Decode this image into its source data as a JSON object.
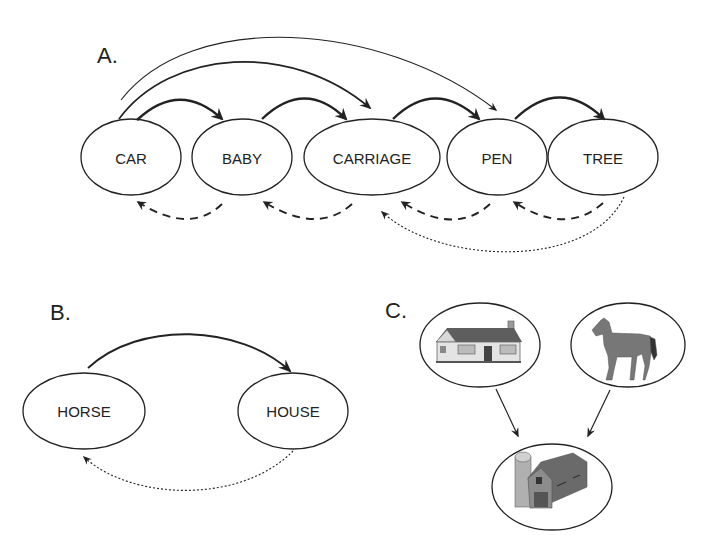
{
  "panels": {
    "a": {
      "label": "A.",
      "nodes": [
        {
          "id": "car",
          "label": "CAR"
        },
        {
          "id": "baby",
          "label": "BABY"
        },
        {
          "id": "carriage",
          "label": "CARRIAGE"
        },
        {
          "id": "pen",
          "label": "PEN"
        },
        {
          "id": "tree",
          "label": "TREE"
        }
      ],
      "edges": [
        {
          "from": "car",
          "to": "baby",
          "style": "solid-thick"
        },
        {
          "from": "baby",
          "to": "carriage",
          "style": "solid-thick"
        },
        {
          "from": "carriage",
          "to": "pen",
          "style": "solid-thick"
        },
        {
          "from": "pen",
          "to": "tree",
          "style": "solid-thick"
        },
        {
          "from": "car",
          "to": "carriage",
          "style": "solid-medium"
        },
        {
          "from": "car",
          "to": "pen",
          "style": "solid-thin"
        },
        {
          "from": "baby",
          "to": "car",
          "style": "dashed"
        },
        {
          "from": "carriage",
          "to": "baby",
          "style": "dashed"
        },
        {
          "from": "pen",
          "to": "carriage",
          "style": "dashed"
        },
        {
          "from": "tree",
          "to": "pen",
          "style": "dashed"
        },
        {
          "from": "tree",
          "to": "carriage",
          "style": "dotted"
        }
      ]
    },
    "b": {
      "label": "B.",
      "nodes": [
        {
          "id": "horse",
          "label": "HORSE"
        },
        {
          "id": "house",
          "label": "HOUSE"
        }
      ],
      "edges": [
        {
          "from": "horse",
          "to": "house",
          "style": "solid"
        },
        {
          "from": "house",
          "to": "horse",
          "style": "dotted"
        }
      ]
    },
    "c": {
      "label": "C.",
      "nodes": [
        {
          "id": "house-picture",
          "icon": "house-icon"
        },
        {
          "id": "horse-picture",
          "icon": "horse-icon"
        },
        {
          "id": "barn-picture",
          "icon": "barn-icon"
        }
      ],
      "edges": [
        {
          "from": "house-picture",
          "to": "barn-picture",
          "style": "solid"
        },
        {
          "from": "horse-picture",
          "to": "barn-picture",
          "style": "solid"
        }
      ]
    }
  },
  "colors": {
    "stroke": "#222222",
    "background": "#ffffff",
    "image_fill": "#7a7a7a"
  }
}
